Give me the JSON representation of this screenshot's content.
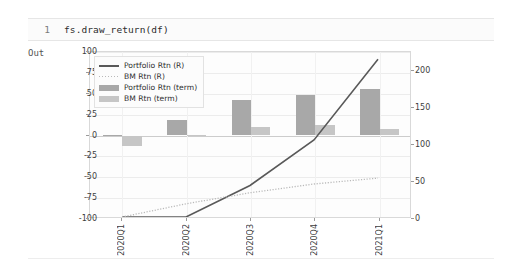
{
  "notebook": {
    "line_number": "1",
    "code": "fs.draw_return(df)",
    "output_label": "Out"
  },
  "chart_data": {
    "type": "bar",
    "title": "",
    "xlabel": "",
    "ylabel": "",
    "grid": true,
    "legend_position": "upper-left",
    "categories": [
      "2020Q1",
      "2020Q2",
      "2020Q3",
      "2020Q4",
      "2021Q1"
    ],
    "left_axis": {
      "label": "",
      "ylim": [
        -100,
        100
      ],
      "ticks": [
        "100",
        "75",
        "50",
        "25",
        "0",
        "-25",
        "-50",
        "-75",
        "-100"
      ],
      "tick_values": [
        100,
        75,
        50,
        25,
        0,
        -25,
        -50,
        -75,
        -100
      ]
    },
    "right_axis": {
      "label": "",
      "ylim": [
        0,
        225
      ],
      "ticks": [
        "200",
        "150",
        "100",
        "50",
        "0"
      ],
      "tick_values": [
        200,
        150,
        100,
        50,
        0
      ]
    },
    "series": [
      {
        "name": "Portfolio Rtn (R)",
        "kind": "line",
        "style": "solid",
        "axis": "right",
        "color": "#595959",
        "values": [
          0,
          0,
          43,
          105,
          215
        ]
      },
      {
        "name": "BM Rtn (R)",
        "kind": "line",
        "style": "dotted",
        "axis": "right",
        "color": "#b9b9b9",
        "values": [
          0,
          18,
          33,
          45,
          53
        ]
      },
      {
        "name": "Portfolio Rtn (term)",
        "kind": "bar",
        "axis": "left",
        "color": "#a8a8a8",
        "values": [
          0.5,
          19,
          43,
          48,
          56
        ]
      },
      {
        "name": "BM Rtn (term)",
        "kind": "bar",
        "axis": "left",
        "color": "#c6c6c6",
        "values": [
          -13,
          0.5,
          10,
          13,
          8
        ]
      }
    ]
  },
  "legend": {
    "items": [
      {
        "label": "Portfolio Rtn (R)"
      },
      {
        "label": "BM Rtn (R)"
      },
      {
        "label": "Portfolio Rtn (term)"
      },
      {
        "label": "BM Rtn (term)"
      }
    ]
  }
}
